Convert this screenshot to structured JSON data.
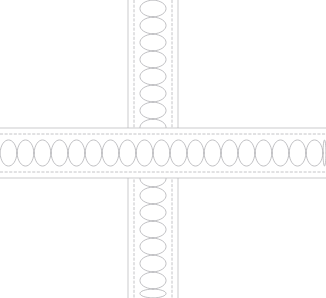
{
  "drawing": {
    "title": "Wall Intersection Detail",
    "type": "cad-section-detail",
    "background_color": "#ffffff",
    "canvas": {
      "width": 326,
      "height": 298
    },
    "line_color": "#aeaeb2",
    "stud_line_color": "#b0b0b4",
    "insulation_color": "#a9a9ad"
  },
  "assemblies": [
    {
      "name": "vertical-wall",
      "orientation": "vertical",
      "axis_center": 153,
      "start": 128,
      "end": 178,
      "thickness": 50,
      "extent_start": 0,
      "extent_end": 298,
      "layers": [
        {
          "name": "sheathing-face-left",
          "offset": 0,
          "kind": "solid-line"
        },
        {
          "name": "stud-line-left",
          "offset": 6,
          "kind": "dashed-line"
        },
        {
          "name": "batt-insulation",
          "offset": 25,
          "kind": "insulation-hatch"
        },
        {
          "name": "stud-line-right",
          "offset": 44,
          "kind": "dashed-line"
        },
        {
          "name": "sheathing-face-right",
          "offset": 50,
          "kind": "solid-line"
        }
      ],
      "insulation": {
        "pattern": "batt-loop",
        "cell_length": 17,
        "cell_count": 18,
        "bulge": 7.2
      }
    },
    {
      "name": "horizontal-wall",
      "orientation": "horizontal",
      "axis_center": 153,
      "start": 128,
      "end": 178,
      "thickness": 50,
      "extent_start": 0,
      "extent_end": 326,
      "layers": [
        {
          "name": "sheathing-face-top",
          "offset": 0,
          "kind": "solid-line"
        },
        {
          "name": "stud-line-top",
          "offset": 6,
          "kind": "dashed-line"
        },
        {
          "name": "batt-insulation",
          "offset": 25,
          "kind": "insulation-hatch"
        },
        {
          "name": "stud-line-bottom",
          "offset": 44,
          "kind": "dashed-line"
        },
        {
          "name": "sheathing-face-bottom",
          "offset": 50,
          "kind": "solid-line"
        }
      ],
      "insulation": {
        "pattern": "batt-loop",
        "cell_length": 17,
        "cell_count": 20,
        "bulge": 7.2
      }
    }
  ],
  "intersection": {
    "name": "wall-junction",
    "x": 128,
    "y": 128,
    "width": 50,
    "height": 50,
    "over": "horizontal-wall"
  }
}
